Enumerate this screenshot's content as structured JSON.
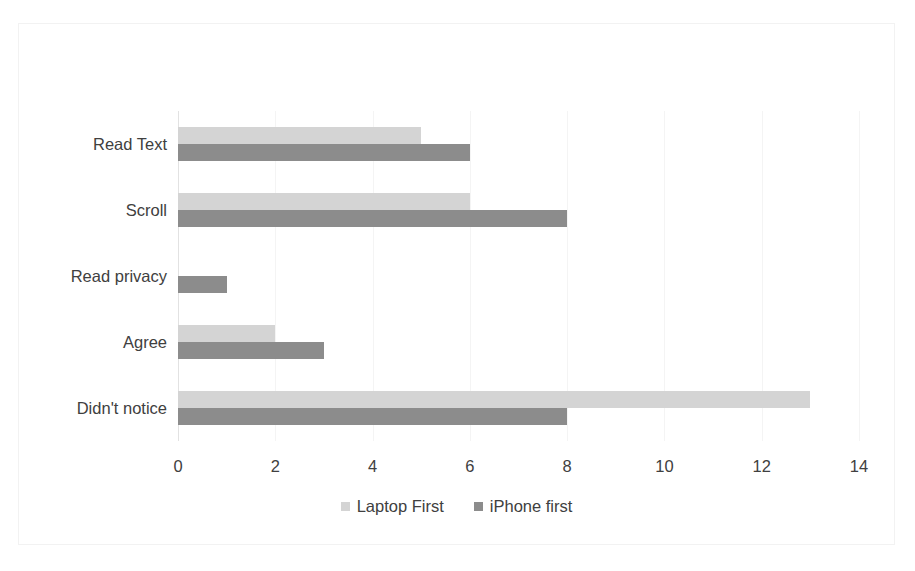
{
  "chart_data": {
    "type": "bar",
    "orientation": "horizontal",
    "title": "",
    "subtitle": "",
    "xlabel": "",
    "ylabel": "",
    "categories": [
      "Read Text",
      "Scroll",
      "Read privacy",
      "Agree",
      "Didn't notice"
    ],
    "series": [
      {
        "name": "Laptop First",
        "color": "#d4d4d4",
        "values": [
          5,
          6,
          0,
          2,
          13
        ]
      },
      {
        "name": "iPhone first",
        "color": "#8c8c8c",
        "values": [
          6,
          8,
          1,
          3,
          8
        ]
      }
    ],
    "xlim": [
      0,
      14
    ],
    "xticks": [
      0,
      2,
      4,
      6,
      8,
      10,
      12,
      14
    ],
    "xtick_labels": [
      "0",
      "2",
      "4",
      "6",
      "8",
      "10",
      "12",
      "14"
    ],
    "grid": true,
    "grid_axis": "x",
    "legend": {
      "position": "bottom",
      "entries": [
        "Laptop First",
        "iPhone first"
      ]
    },
    "annotations": [],
    "colors": {
      "laptop_first": "#d4d4d4",
      "iphone_first": "#8c8c8c",
      "text": "#404040",
      "gridline": "#f4f4f4",
      "border": "#f2f2f2",
      "background": "#ffffff"
    }
  }
}
